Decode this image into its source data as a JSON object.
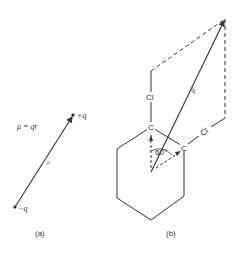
{
  "figure_a": {
    "caption": "(a)",
    "equation": "μ = qr",
    "positive_charge": "+q",
    "negative_charge": "−q",
    "vector_label": "r"
  },
  "figure_b": {
    "caption": "(b)",
    "atom_carbon": "C",
    "atom_chlorine": "Cl",
    "resultant_label": "μ",
    "angle_label": "60°"
  },
  "colors": {
    "line": "#333333",
    "background": "#ffffff"
  }
}
